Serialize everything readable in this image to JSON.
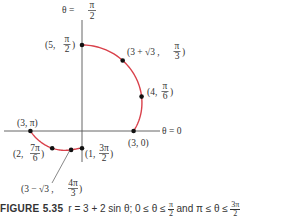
{
  "figure": {
    "curve_color": "#d9414b",
    "axis_color": "#555555",
    "point_color": "#111111",
    "axis_labels": {
      "vertical": {
        "prefix": "θ =",
        "num": "π",
        "den": "2"
      },
      "horizontal": "θ = 0"
    },
    "points": [
      {
        "r": 5,
        "theta": 1.5708,
        "label_pre": "(5, ",
        "num": "π",
        "den": "2",
        "label_post": ")"
      },
      {
        "r": 4.7321,
        "theta": 1.0472,
        "label_pre": "(3 + √3 , ",
        "num": "π",
        "den": "3",
        "label_post": ")"
      },
      {
        "r": 4,
        "theta": 0.5236,
        "label_pre": "(4, ",
        "num": "π",
        "den": "6",
        "label_post": ")"
      },
      {
        "r": 3,
        "theta": 0,
        "label_pre": "(3, 0)",
        "num": "",
        "den": "",
        "label_post": ""
      },
      {
        "r": 3,
        "theta": 3.1416,
        "label_pre": "(3, π)",
        "num": "",
        "den": "",
        "label_post": ""
      },
      {
        "r": 2,
        "theta": 3.6652,
        "label_pre": "(2, ",
        "num": "7π",
        "den": "6",
        "label_post": ")"
      },
      {
        "r": 1.2679,
        "theta": 4.1888,
        "label_pre": "(3 − √3 , ",
        "num": "4π",
        "den": "3",
        "label_post": ")"
      },
      {
        "r": 1,
        "theta": 4.7124,
        "label_pre": "(1, ",
        "num": "3π",
        "den": "2",
        "label_post": ")"
      }
    ],
    "curve": {
      "equation": "r = 3 + 2 sin θ",
      "ranges": [
        [
          0,
          1.5708
        ],
        [
          3.1416,
          4.7124
        ]
      ]
    }
  },
  "caption": {
    "label": "FIGURE 5.35",
    "equation": "r = 3 + 2 sin θ; 0 ≤ θ ≤",
    "frac1_num": "π",
    "frac1_den": "2",
    "middle": "and π ≤ θ ≤",
    "frac2_num": "3π",
    "frac2_den": "2"
  }
}
